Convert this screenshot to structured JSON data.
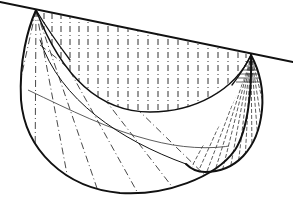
{
  "figure": {
    "stroke_color": "#111111",
    "hatch_color": "#333333",
    "background": "#ffffff",
    "points": {
      "top_line_start": [
        0,
        2
      ],
      "top_line_end": [
        293,
        62
      ],
      "apex_left": [
        36,
        10
      ],
      "apex_right": [
        251,
        55
      ]
    }
  }
}
